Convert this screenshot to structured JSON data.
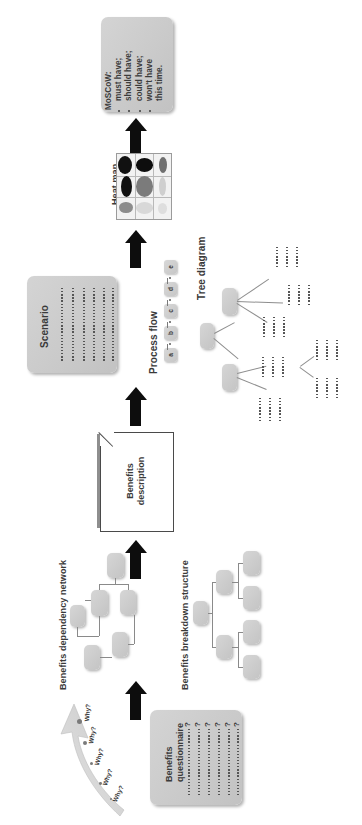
{
  "diagram": {
    "orientation": "rotated-90",
    "accent_color": "#0d0d0d",
    "box_fill": "#c9c9c9"
  },
  "moscow": {
    "heading": "MoSCoW:",
    "items": [
      "must have;",
      "should have;",
      "could have;",
      "won't have",
      "this time."
    ]
  },
  "heatmap": {
    "label": "Heat map",
    "rows": 3,
    "cols": 3,
    "cells": [
      {
        "shade": "#111111",
        "w": 0.78,
        "h": 0.86
      },
      {
        "shade": "#0d0d0d",
        "w": 0.95,
        "h": 0.62
      },
      {
        "shade": "#707070",
        "w": 0.44,
        "h": 0.74
      },
      {
        "shade": "#101010",
        "w": 0.6,
        "h": 0.98
      },
      {
        "shade": "#7b7b7b",
        "w": 0.94,
        "h": 0.94
      },
      {
        "shade": "#cfcfcf",
        "w": 0.4,
        "h": 0.9
      },
      {
        "shade": "#8c8c8c",
        "w": 0.74,
        "h": 0.5
      },
      {
        "shade": "#d8d8d8",
        "w": 0.94,
        "h": 0.54
      },
      {
        "shade": "#dedede",
        "w": 0.5,
        "h": 0.48
      }
    ]
  },
  "scenario": {
    "label": "Scenario",
    "text_lines": 6
  },
  "process_flow": {
    "label": "Process flow",
    "steps": [
      "a",
      "b",
      "c",
      "d",
      "e"
    ]
  },
  "tree_diagram": {
    "label": "Tree diagram",
    "root_nodes": 1,
    "branch_nodes": 2,
    "leaf_groups": 5
  },
  "benefits_description": {
    "label_line1": "Benefits",
    "label_line2": "description"
  },
  "benefits_dependency_network": {
    "label": "Benefits dependency network",
    "node_count": 6
  },
  "benefits_breakdown_structure": {
    "label": "Benefits breakdown structure",
    "node_count": 7
  },
  "benefits_questionnaire": {
    "label_line1": "Benefits",
    "label_line2": "questionnaire",
    "question_lines": 6,
    "question_mark": "?"
  },
  "why_arrow": {
    "labels": [
      "Why?",
      "Why?",
      "Why?",
      "Why?",
      "Why?"
    ]
  }
}
